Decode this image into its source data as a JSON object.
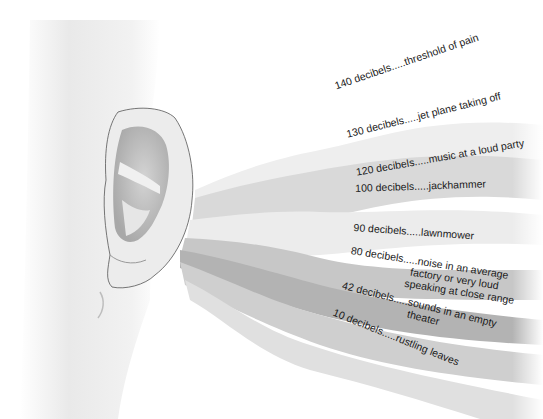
{
  "diagram": {
    "levels": [
      {
        "db": "140 decibels",
        "desc": "threshold of pain"
      },
      {
        "db": "130 decibels",
        "desc": "jet plane taking off"
      },
      {
        "db": "120 decibels",
        "desc": "music at a loud party"
      },
      {
        "db": "100 decibels",
        "desc": "jackhammer"
      },
      {
        "db": "90 decibels",
        "desc": "lawnmower"
      },
      {
        "db": "80 decibels",
        "desc": "noise in an average",
        "desc2": "factory or very loud",
        "desc3": "speaking at close range"
      },
      {
        "db": "42 decibels",
        "desc": "sounds in an empty",
        "desc2": "theater"
      },
      {
        "db": "10 decibels",
        "desc": "rustling leaves"
      }
    ],
    "separator": ".....",
    "colors": {
      "background": "#ffffff",
      "skin": "#e6e6e6",
      "skin_shadow": "#c8c8c8",
      "ear_outline": "#555555",
      "wave_light": "#eeeeee",
      "wave_mid": "#cfcfcf",
      "wave_dark": "#a9a9a9",
      "text": "#1a1a1a"
    }
  }
}
